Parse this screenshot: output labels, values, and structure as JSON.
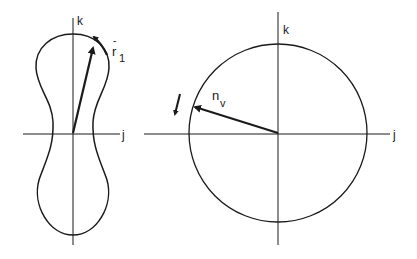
{
  "left_diagram": {
    "axes": {
      "vertical_label": "k",
      "horizontal_label": "j"
    },
    "vector": {
      "symbol": "r",
      "accent": "-",
      "subscript": "1"
    },
    "curve": "peanut-shaped closed curve"
  },
  "right_diagram": {
    "axes": {
      "vertical_label": "k",
      "horizontal_label": "j"
    },
    "vector": {
      "symbol": "n",
      "subscript": "v"
    },
    "curve": "circle"
  },
  "colors": {
    "stroke": "#1a1a1a",
    "background": "#ffffff"
  }
}
